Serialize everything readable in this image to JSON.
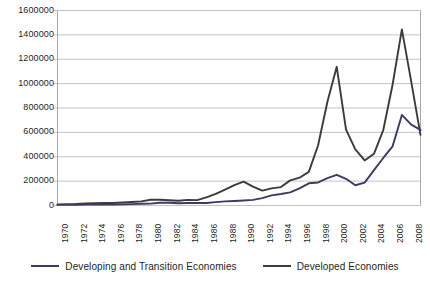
{
  "chart_data": {
    "type": "line",
    "title": "",
    "subtitle": "",
    "xlabel": "",
    "ylabel": "",
    "grid": true,
    "legend_position": "bottom",
    "xlim": [
      1970,
      2009
    ],
    "ylim": [
      0,
      1600000
    ],
    "y_ticks": [
      0,
      200000,
      400000,
      600000,
      800000,
      1000000,
      1200000,
      1400000,
      1600000
    ],
    "y_tick_labels": [
      "0",
      "200000",
      "400000",
      "600000",
      "800000",
      "1000000",
      "1200000",
      "1400000",
      "1600000"
    ],
    "x_ticks": [
      1970,
      1972,
      1974,
      1976,
      1978,
      1980,
      1982,
      1984,
      1986,
      1988,
      1990,
      1992,
      1994,
      1996,
      1998,
      2000,
      2002,
      2004,
      2006,
      2008
    ],
    "x_tick_labels": [
      "1970",
      "1972",
      "1974",
      "1976",
      "1978",
      "1980",
      "1982",
      "1984",
      "1986",
      "1988",
      "1990",
      "1992",
      "1994",
      "1996",
      "1998",
      "2000",
      "2002",
      "2004",
      "2006",
      "2008"
    ],
    "x": [
      1970,
      1971,
      1972,
      1973,
      1974,
      1975,
      1976,
      1977,
      1978,
      1979,
      1980,
      1981,
      1982,
      1983,
      1984,
      1985,
      1986,
      1987,
      1988,
      1989,
      1990,
      1991,
      1992,
      1993,
      1994,
      1995,
      1996,
      1997,
      1998,
      1999,
      2000,
      2001,
      2002,
      2003,
      2004,
      2005,
      2006,
      2007,
      2008,
      2009
    ],
    "series": [
      {
        "name": "Developed Economies",
        "color": "#3b3b3b",
        "values": [
          9000,
          11000,
          12000,
          17000,
          19000,
          20000,
          20000,
          24000,
          29000,
          34000,
          47000,
          47000,
          43000,
          39000,
          46000,
          44000,
          66000,
          95000,
          131000,
          168000,
          196000,
          155000,
          122000,
          141000,
          151000,
          206000,
          228000,
          276000,
          494000,
          851000,
          1138000,
          622000,
          460000,
          370000,
          424000,
          619000,
          991000,
          1445000,
          1019000,
          580000
        ]
      },
      {
        "name": "Developing and Transition Economies",
        "color": "#3c3b63",
        "values": [
          5000,
          5000,
          6000,
          7000,
          8000,
          9000,
          8000,
          9000,
          11000,
          14000,
          15000,
          22000,
          23000,
          19000,
          20000,
          21000,
          20000,
          28000,
          34000,
          37000,
          41000,
          46000,
          61000,
          83000,
          94000,
          108000,
          140000,
          182000,
          189000,
          224000,
          252000,
          219000,
          166000,
          188000,
          290000,
          390000,
          485000,
          743000,
          663000,
          620000
        ]
      }
    ],
    "annotations": []
  },
  "legend": {
    "items": [
      {
        "label": "Developing and Transition Economies",
        "color": "#3c3b63"
      },
      {
        "label": "Developed Economies",
        "color": "#3b3b3b"
      }
    ]
  },
  "axis_style": {
    "gridline_color": "#b9bcc0",
    "frame_color": "#9a9da1",
    "text_color": "#231f20"
  }
}
